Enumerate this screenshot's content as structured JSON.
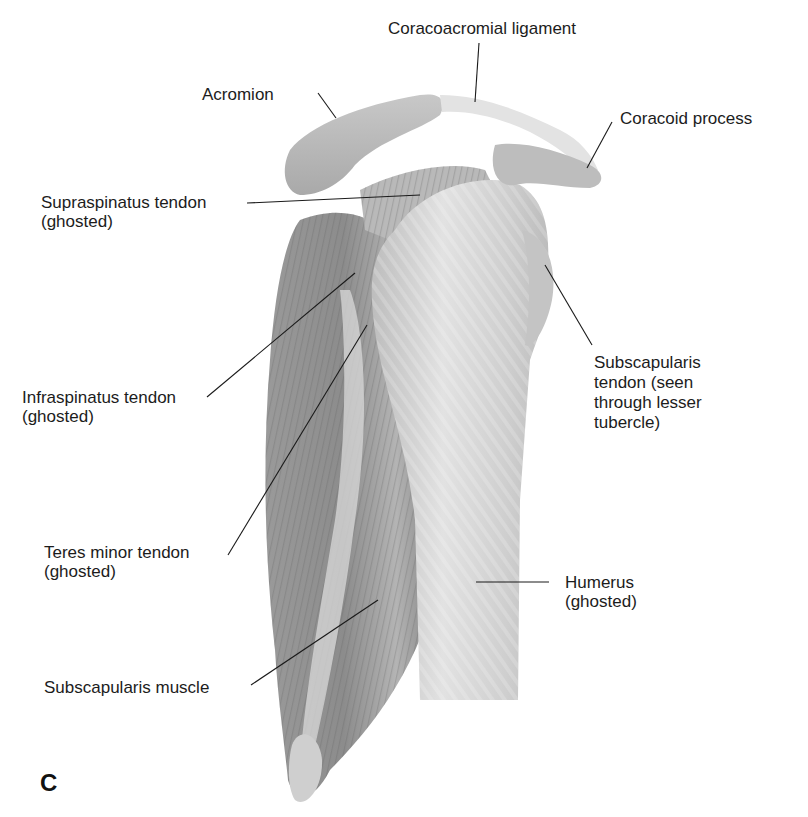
{
  "figure": {
    "panel_letter": "C",
    "labels": {
      "coracoacromial_ligament": "Coracoacromial ligament",
      "acromion": "Acromion",
      "coracoid_process": "Coracoid process",
      "supraspinatus_tendon": "Supraspinatus tendon\n(ghosted)",
      "subscapularis_tendon": "Subscapularis\ntendon (seen\nthrough lesser\ntubercle)",
      "infraspinatus_tendon": "Infraspinatus tendon\n(ghosted)",
      "teres_minor_tendon": "Teres minor tendon\n(ghosted)",
      "humerus": "Humerus\n(ghosted)",
      "subscapularis_muscle": "Subscapularis muscle"
    },
    "colors": {
      "background": "#ffffff",
      "muscle_dark": "#8a8a8a",
      "muscle_mid": "#a8a8a8",
      "bone_light": "#d4d4d4",
      "leader_line": "#1a1a1a"
    }
  }
}
